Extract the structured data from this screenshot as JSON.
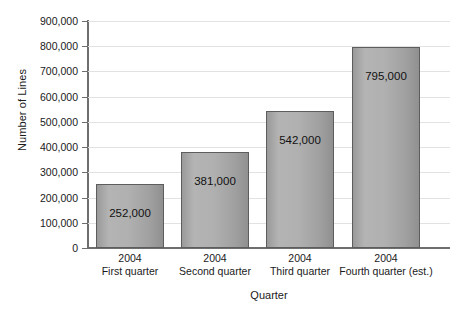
{
  "chart_data": {
    "type": "bar",
    "title": "",
    "xlabel": "Quarter",
    "ylabel": "Number of Lines",
    "categories": [
      "2004 First quarter",
      "2004 Second quarter",
      "2004 Third quarter",
      "2004 Fourth quarter (est.)"
    ],
    "category_lines": [
      {
        "year": "2004",
        "name": "First quarter"
      },
      {
        "year": "2004",
        "name": "Second quarter"
      },
      {
        "year": "2004",
        "name": "Third quarter"
      },
      {
        "year": "2004",
        "name": "Fourth quarter (est.)"
      }
    ],
    "values": [
      252000,
      381000,
      542000,
      795000
    ],
    "value_labels": [
      "252,000",
      "381,000",
      "542,000",
      "795,000"
    ],
    "ylim": [
      0,
      900000
    ],
    "ytick_values": [
      0,
      100000,
      200000,
      300000,
      400000,
      500000,
      600000,
      700000,
      800000,
      900000
    ],
    "ytick_labels": [
      "900,000",
      "800,000",
      "700,000",
      "600,000",
      "500,000",
      "400,000",
      "300,000",
      "200,000",
      "100,000",
      "0"
    ],
    "grid": true,
    "legend": false,
    "colors": {
      "bar_fill_light": "#b4b4b4",
      "bar_fill_dark": "#909090",
      "bar_border": "#5d5d5d",
      "gridline": "#e2e2e2",
      "axis": "#6e6e6e",
      "text": "#1a1a1a",
      "background": "#ffffff"
    }
  }
}
